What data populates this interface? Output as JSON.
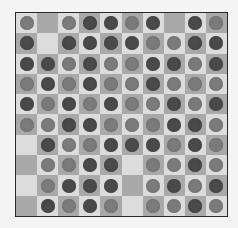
{
  "board": {
    "rows": 10,
    "cols": 10,
    "colors": {
      "light_square": "#dcdcdc",
      "dark_square": "#a9a9a9",
      "dark_piece": "#4a4a4a",
      "medium_piece": "#7b7b7b"
    },
    "legend": {
      "d": "dark-piece",
      "m": "medium-piece",
      "": "empty"
    },
    "cells": [
      [
        "m",
        "",
        "m",
        "d",
        "d",
        "m",
        "d",
        "",
        "d",
        "m"
      ],
      [
        "d",
        "",
        "d",
        "d",
        "d",
        "d",
        "m",
        "m",
        "d",
        "d"
      ],
      [
        "d",
        "d",
        "m",
        "d",
        "m",
        "m",
        "d",
        "d",
        "m",
        "d"
      ],
      [
        "m",
        "d",
        "m",
        "d",
        "m",
        "m",
        "d",
        "m",
        "m",
        "m"
      ],
      [
        "d",
        "m",
        "d",
        "m",
        "d",
        "m",
        "m",
        "d",
        "m",
        "d"
      ],
      [
        "m",
        "m",
        "d",
        "d",
        "m",
        "m",
        "m",
        "d",
        "d",
        "m"
      ],
      [
        "",
        "d",
        "m",
        "m",
        "d",
        "d",
        "d",
        "m",
        "d",
        "m"
      ],
      [
        "",
        "m",
        "m",
        "d",
        "d",
        "",
        "m",
        "m",
        "d",
        "m"
      ],
      [
        "",
        "m",
        "d",
        "d",
        "d",
        "",
        "m",
        "d",
        "m",
        "d"
      ],
      [
        "",
        "d",
        "m",
        "d",
        "m",
        "",
        "m",
        "m",
        "d",
        "m"
      ]
    ]
  }
}
